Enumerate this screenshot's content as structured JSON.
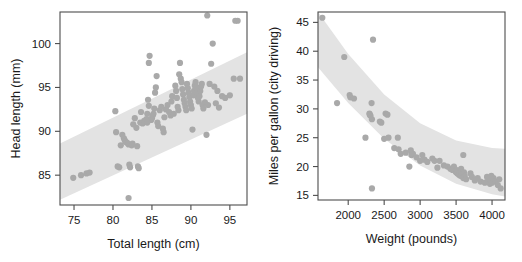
{
  "figure": {
    "background": "#ffffff",
    "point_color": "#a9a9a9",
    "band_color": "#e3e3e3",
    "axis_color": "#4d4d4d",
    "point_radius": 3.1
  },
  "chart_data": [
    {
      "type": "scatter",
      "title": "",
      "xlabel": "Total length (cm)",
      "ylabel": "Head length (mm)",
      "xlim": [
        73.2,
        97.2
      ],
      "ylim": [
        81.6,
        103.6
      ],
      "xticks": [
        75,
        80,
        85,
        90,
        95
      ],
      "yticks": [
        85,
        90,
        95,
        100
      ],
      "grid": false,
      "legend": "none",
      "band": {
        "label": "prediction band",
        "type": "linear",
        "x": [
          73.2,
          97.2
        ],
        "lower": [
          82.2,
          92.0
        ],
        "upper": [
          88.6,
          99.0
        ]
      },
      "x": [
        74.9,
        75.9,
        76.6,
        77.0,
        80.3,
        80.4,
        80.6,
        80.8,
        81.0,
        81.2,
        81.4,
        81.5,
        81.6,
        81.8,
        82.0,
        82.1,
        82.2,
        82.4,
        82.5,
        82.6,
        82.8,
        83.0,
        83.1,
        83.2,
        83.3,
        83.5,
        83.6,
        83.8,
        84.0,
        84.2,
        84.3,
        84.4,
        84.5,
        84.6,
        84.7,
        84.9,
        85.0,
        85.1,
        85.2,
        85.3,
        85.4,
        85.5,
        85.6,
        85.7,
        85.8,
        86.0,
        86.2,
        86.4,
        86.5,
        86.6,
        86.8,
        87.0,
        87.2,
        87.4,
        87.5,
        87.6,
        87.8,
        88.0,
        88.1,
        88.2,
        88.3,
        88.4,
        88.5,
        88.6,
        88.7,
        88.8,
        88.9,
        89.0,
        89.1,
        89.2,
        89.3,
        89.4,
        89.5,
        89.6,
        89.7,
        89.8,
        89.9,
        90.0,
        90.1,
        90.2,
        90.3,
        90.4,
        90.5,
        90.6,
        90.7,
        90.8,
        90.9,
        91.0,
        91.1,
        91.2,
        91.3,
        91.4,
        91.5,
        91.6,
        91.8,
        92.0,
        92.2,
        92.4,
        92.6,
        92.8,
        93.0,
        93.2,
        93.4,
        93.6,
        94.0,
        94.4,
        95.0,
        95.5,
        96.0,
        96.3,
        82.0,
        84.4,
        84.6,
        92.1,
        95.7
      ],
      "y": [
        84.7,
        85.0,
        85.2,
        85.3,
        92.3,
        89.9,
        86.0,
        85.9,
        88.4,
        89.6,
        89.2,
        89.0,
        88.8,
        88.7,
        88.5,
        86.2,
        85.9,
        88.4,
        88.6,
        90.8,
        91.5,
        90.4,
        88.3,
        86.0,
        85.8,
        91.0,
        92.2,
        90.9,
        91.2,
        91.1,
        91.4,
        92.0,
        93.6,
        97.8,
        98.6,
        91.3,
        91.5,
        91.8,
        92.0,
        92.6,
        94.4,
        95.0,
        96.3,
        91.0,
        90.6,
        92.4,
        92.8,
        90.3,
        89.9,
        91.6,
        92.5,
        93.0,
        92.2,
        91.8,
        93.4,
        94.0,
        92.0,
        95.2,
        94.6,
        93.8,
        92.8,
        92.4,
        96.5,
        97.8,
        96.0,
        95.6,
        94.8,
        94.2,
        93.6,
        93.2,
        92.8,
        92.4,
        95.4,
        94.9,
        94.4,
        93.9,
        93.4,
        93.0,
        92.6,
        90.2,
        94.1,
        94.6,
        95.2,
        95.6,
        95.0,
        94.4,
        93.8,
        93.4,
        94.0,
        94.6,
        95.1,
        95.4,
        93.0,
        92.6,
        93.3,
        89.6,
        93.0,
        95.4,
        97.7,
        100.0,
        95.1,
        93.2,
        94.6,
        92.7,
        94.0,
        93.8,
        94.1,
        96.0,
        102.6,
        96.0,
        82.4,
        91.0,
        92.9,
        103.2,
        102.6
      ]
    },
    {
      "type": "scatter",
      "title": "",
      "xlabel": "Weight (pounds)",
      "ylabel": "Miles per gallon (city driving)",
      "xlim": [
        1580,
        4180
      ],
      "ylim": [
        14.2,
        46.8
      ],
      "xticks": [
        2000,
        2500,
        3000,
        3500,
        4000
      ],
      "yticks": [
        15,
        20,
        25,
        30,
        35,
        40,
        45
      ],
      "grid": false,
      "legend": "none",
      "band": {
        "label": "prediction band",
        "type": "curved",
        "x": [
          1580,
          2000,
          2500,
          3000,
          3500,
          4000,
          4180
        ],
        "upper": [
          46.8,
          39.5,
          32.5,
          27.5,
          24.5,
          23.2,
          23.1
        ],
        "lower": [
          37.2,
          31.0,
          24.8,
          20.2,
          17.0,
          15.2,
          14.8
        ]
      },
      "x": [
        1640,
        1845,
        1945,
        2020,
        2030,
        2080,
        2240,
        2295,
        2300,
        2310,
        2325,
        2330,
        2345,
        2440,
        2460,
        2500,
        2520,
        2545,
        2560,
        2640,
        2690,
        2700,
        2730,
        2800,
        2850,
        2870,
        2880,
        2900,
        2950,
        3000,
        3030,
        3060,
        3100,
        3170,
        3200,
        3240,
        3270,
        3330,
        3380,
        3420,
        3450,
        3470,
        3490,
        3500,
        3510,
        3520,
        3530,
        3540,
        3550,
        3560,
        3570,
        3580,
        3600,
        3610,
        3620,
        3640,
        3700,
        3720,
        3760,
        3800,
        3840,
        3900,
        3930,
        3950,
        3970,
        3990,
        4000,
        4020,
        4050,
        4080,
        4100,
        4120,
        2330,
        3600
      ],
      "y": [
        45.8,
        31.0,
        39.0,
        32.4,
        32.0,
        31.8,
        25.0,
        29.2,
        29.0,
        28.8,
        31.0,
        28.2,
        42.0,
        27.8,
        27.6,
        24.8,
        29.2,
        29.0,
        25.0,
        23.2,
        25.0,
        23.0,
        22.2,
        22.4,
        20.0,
        22.8,
        22.0,
        22.2,
        21.6,
        21.0,
        22.0,
        21.2,
        20.8,
        21.4,
        21.0,
        19.8,
        21.0,
        20.2,
        20.0,
        19.6,
        19.4,
        20.0,
        19.2,
        19.0,
        19.4,
        18.8,
        19.2,
        18.6,
        19.0,
        18.4,
        19.6,
        18.8,
        18.0,
        19.0,
        18.4,
        17.8,
        18.8,
        18.2,
        17.6,
        18.0,
        17.4,
        17.2,
        18.2,
        17.6,
        17.0,
        18.4,
        17.2,
        18.0,
        17.4,
        16.8,
        17.8,
        16.2,
        16.2,
        22.0
      ]
    }
  ]
}
